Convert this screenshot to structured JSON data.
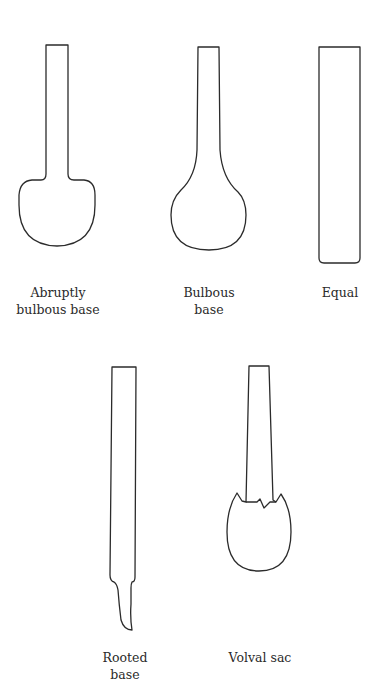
{
  "diagram": {
    "stem_types": [
      {
        "id": "abruptly-bulbous",
        "label_lines": [
          "Abruptly",
          "bulbous base"
        ]
      },
      {
        "id": "bulbous",
        "label_lines": [
          "Bulbous",
          "base"
        ]
      },
      {
        "id": "equal",
        "label_lines": [
          "Equal"
        ]
      },
      {
        "id": "rooted",
        "label_lines": [
          "Rooted",
          "base"
        ]
      },
      {
        "id": "volval-sac",
        "label_lines": [
          "Volval sac"
        ]
      }
    ]
  },
  "colors": {
    "outline": "#2b2b2b",
    "background": "#ffffff",
    "text": "#2a2a2a"
  }
}
